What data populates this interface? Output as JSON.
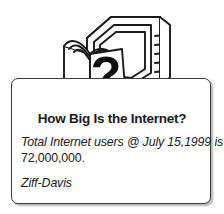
{
  "card": {
    "title": "How Big Is the Internet?",
    "body_lines": [
      {
        "text": "Total Internet users @ July 15,1999 is",
        "style": "italic"
      },
      {
        "text": "72,000,000.",
        "style": "roman"
      }
    ],
    "source": "Ziff-Davis",
    "statistic": {
      "label": "Total Internet users",
      "as_of_date": "July 15,1999",
      "value": "72,000,000"
    },
    "colors": {
      "background": "#ffffff",
      "box_border": "#3a3a3a",
      "text": "#1a1a1a",
      "ink": "#1a1a1a"
    }
  },
  "illustration": {
    "description": "open book with question mark in front of a computer monitor",
    "question_mark": "?"
  }
}
